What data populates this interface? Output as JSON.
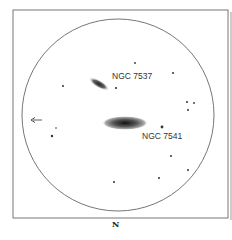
{
  "diagram": {
    "type": "telescope field sketch",
    "labels": {
      "galaxy_1": "NGC 7537",
      "galaxy_2": "NGC 7541",
      "north": "N",
      "direction_arrow": "←"
    },
    "colors": {
      "ink": "#333333",
      "frame": "#777777",
      "background": "#ffffff"
    }
  }
}
